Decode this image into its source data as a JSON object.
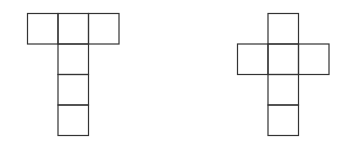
{
  "diagram": {
    "stroke_color": "#333333",
    "background_color": "#ffffff",
    "nets": [
      {
        "name": "t-shaped-net",
        "cells": [
          [
            0,
            0
          ],
          [
            1,
            0
          ],
          [
            2,
            0
          ],
          [
            1,
            1
          ],
          [
            1,
            2
          ],
          [
            1,
            3
          ]
        ]
      },
      {
        "name": "cross-shaped-net",
        "cells": [
          [
            1,
            0
          ],
          [
            0,
            1
          ],
          [
            1,
            1
          ],
          [
            2,
            1
          ],
          [
            1,
            2
          ],
          [
            1,
            3
          ]
        ]
      }
    ]
  }
}
